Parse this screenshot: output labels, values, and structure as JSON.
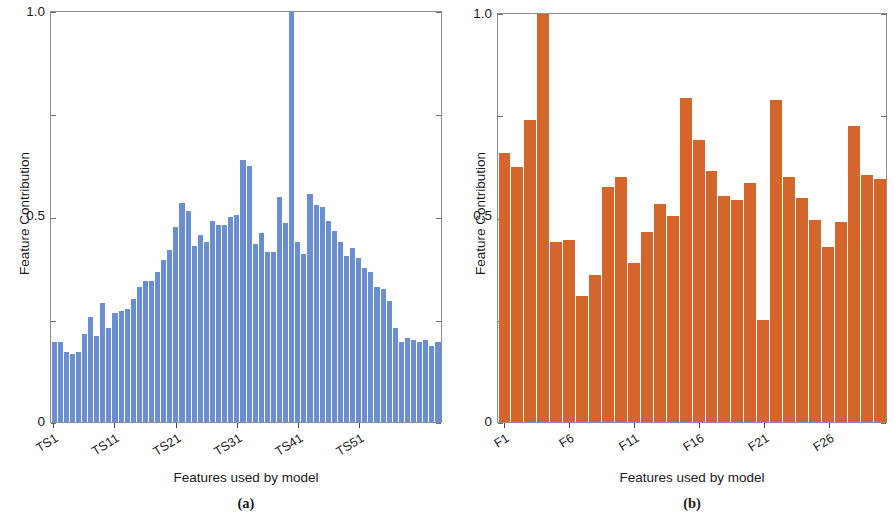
{
  "figure": {
    "panels": [
      {
        "id": "a",
        "caption": "(a)",
        "color": "#6a8fd0"
      },
      {
        "id": "b",
        "caption": "(b)",
        "color": "#d4662c"
      }
    ]
  },
  "chart_data": [
    {
      "type": "bar",
      "panel": "a",
      "title": "",
      "xlabel": "Features used by model",
      "ylabel": "Feature Contribution",
      "ylim": [
        0,
        1.0
      ],
      "ytick_labels": [
        "1.0",
        "0.5",
        "0"
      ],
      "ytick_values": [
        1.0,
        0.5,
        0
      ],
      "yminor_ticks": [
        0.75,
        0.25
      ],
      "grid": false,
      "legend": null,
      "bar_color": "#6a8fd0",
      "xtick_labels": [
        "TS1",
        "TS11",
        "TS21",
        "TS31",
        "TS41",
        "TS51"
      ],
      "xtick_indices": [
        0,
        10,
        20,
        30,
        40,
        50
      ],
      "categories": [
        "TS1",
        "TS2",
        "TS3",
        "TS4",
        "TS5",
        "TS6",
        "TS7",
        "TS8",
        "TS9",
        "TS10",
        "TS11",
        "TS12",
        "TS13",
        "TS14",
        "TS15",
        "TS16",
        "TS17",
        "TS18",
        "TS19",
        "TS20",
        "TS21",
        "TS22",
        "TS23",
        "TS24",
        "TS25",
        "TS26",
        "TS27",
        "TS28",
        "TS29",
        "TS30",
        "TS31",
        "TS32",
        "TS33",
        "TS34",
        "TS35",
        "TS36",
        "TS37",
        "TS38",
        "TS39",
        "TS40",
        "TS41",
        "TS42",
        "TS43",
        "TS44",
        "TS45",
        "TS46",
        "TS47",
        "TS48",
        "TS49",
        "TS50",
        "TS51",
        "TS52",
        "TS53",
        "TS54",
        "TS55",
        "TS56",
        "TS57",
        "TS58",
        "TS59",
        "TS60"
      ],
      "values": [
        0.195,
        0.195,
        0.17,
        0.165,
        0.17,
        0.215,
        0.255,
        0.21,
        0.29,
        0.23,
        0.265,
        0.27,
        0.275,
        0.3,
        0.33,
        0.345,
        0.345,
        0.365,
        0.395,
        0.42,
        0.475,
        0.535,
        0.515,
        0.43,
        0.455,
        0.44,
        0.49,
        0.48,
        0.48,
        0.5,
        0.505,
        0.64,
        0.625,
        0.435,
        0.46,
        0.415,
        0.415,
        0.55,
        0.485,
        1.0,
        0.44,
        0.41,
        0.555,
        0.53,
        0.525,
        0.49,
        0.465,
        0.44,
        0.405,
        0.425,
        0.4,
        0.375,
        0.365,
        0.33,
        0.325,
        0.295,
        0.23,
        0.195,
        0.205,
        0.2,
        0.195,
        0.2,
        0.185,
        0.195
      ]
    },
    {
      "type": "bar",
      "panel": "b",
      "title": "",
      "xlabel": "Features used by model",
      "ylabel": "Feature Contribution",
      "ylim": [
        0,
        1.0
      ],
      "ytick_labels": [
        "1.0",
        "0.5",
        "0"
      ],
      "ytick_values": [
        1.0,
        0.5,
        0
      ],
      "yminor_ticks": [
        0.75,
        0.25
      ],
      "grid": false,
      "legend": null,
      "bar_color": "#d4662c",
      "xtick_labels": [
        "F1",
        "F6",
        "F11",
        "F16",
        "F21",
        "F26"
      ],
      "xtick_indices": [
        0,
        5,
        10,
        15,
        20,
        25
      ],
      "categories": [
        "F1",
        "F2",
        "F3",
        "F4",
        "F5",
        "F6",
        "F7",
        "F8",
        "F9",
        "F10",
        "F11",
        "F12",
        "F13",
        "F14",
        "F15",
        "F16",
        "F17",
        "F18",
        "F19",
        "F20",
        "F21",
        "F22",
        "F23",
        "F24",
        "F25",
        "F26",
        "F27",
        "F28",
        "F29",
        "F30"
      ],
      "values": [
        0.66,
        0.625,
        0.74,
        1.0,
        0.44,
        0.445,
        0.31,
        0.36,
        0.575,
        0.6,
        0.39,
        0.465,
        0.535,
        0.505,
        0.795,
        0.69,
        0.615,
        0.555,
        0.545,
        0.585,
        0.25,
        0.79,
        0.6,
        0.55,
        0.495,
        0.43,
        0.49,
        0.725,
        0.605,
        0.595
      ]
    }
  ]
}
